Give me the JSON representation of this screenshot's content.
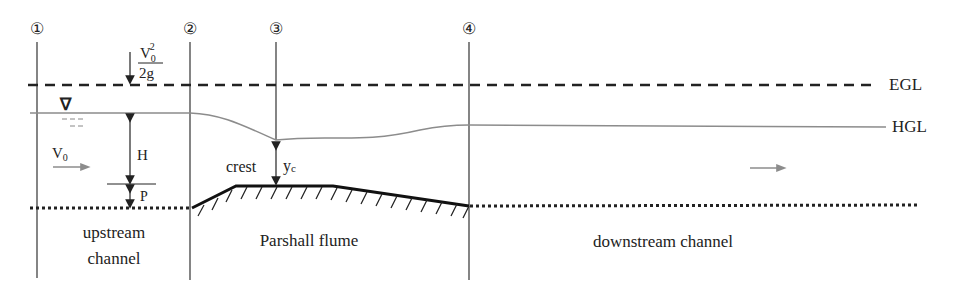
{
  "diagram": {
    "type": "open-channel flow profile through a Parshall flume",
    "sections": [
      {
        "id": "1",
        "label": "①",
        "x": 37
      },
      {
        "id": "2",
        "label": "②",
        "x": 190
      },
      {
        "id": "3",
        "label": "③",
        "x": 276
      },
      {
        "id": "4",
        "label": "④",
        "x": 469
      }
    ],
    "lines": {
      "egl_label": "EGL",
      "hgl_label": "HGL"
    },
    "annotations": {
      "velocity_head_numerator_base": "V",
      "velocity_head_numerator_sub": "0",
      "velocity_head_numerator_sup": "2",
      "velocity_head_denominator": "2g",
      "free_surface_symbol": "∇",
      "approach_velocity_base": "V",
      "approach_velocity_sub": "0",
      "head": "H",
      "weir_height": "P",
      "crest": "crest",
      "critical_depth_base": "y",
      "critical_depth_sub": "c"
    },
    "regions": {
      "upstream_line1": "upstream",
      "upstream_line2": "channel",
      "flume": "Parshall flume",
      "downstream": "downstream channel"
    },
    "colors": {
      "ink": "#222222",
      "hgl": "#8c8c8c",
      "arrow_gray": "#8c8c8c"
    }
  }
}
